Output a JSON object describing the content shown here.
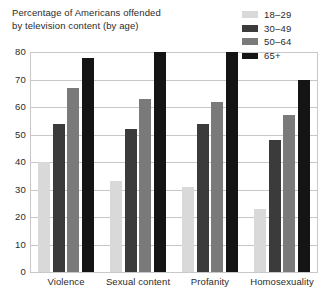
{
  "chart_data": {
    "type": "bar",
    "title": "Percentage of Americans offended by television content (by age)",
    "title_lines": [
      "Percentage of Americans offended",
      "by television content (by age)"
    ],
    "xlabel": "",
    "ylabel": "",
    "ylim": [
      0,
      80
    ],
    "yticks": [
      0,
      10,
      20,
      30,
      40,
      50,
      60,
      70,
      80
    ],
    "ytick_labels": [
      "0",
      "10",
      "20",
      "30",
      "40",
      "50",
      "60",
      "70",
      "80"
    ],
    "grid": true,
    "legend_position": "top-right",
    "categories": [
      "Violence",
      "Sexual content",
      "Profanity",
      "Homosexuality"
    ],
    "series": [
      {
        "name": "18–29",
        "color": "#d9d9d9",
        "values": [
          40,
          33,
          31,
          23
        ]
      },
      {
        "name": "30–49",
        "color": "#3b3b3b",
        "values": [
          54,
          52,
          54,
          48
        ]
      },
      {
        "name": "50–64",
        "color": "#7a7a7a",
        "values": [
          67,
          63,
          62,
          57
        ]
      },
      {
        "name": "65+",
        "color": "#141414",
        "values": [
          78,
          80,
          80,
          70
        ]
      }
    ]
  },
  "colors": {
    "background": "#ffffff",
    "grid": "#c8c8c8",
    "text": "#2b2b2b"
  }
}
